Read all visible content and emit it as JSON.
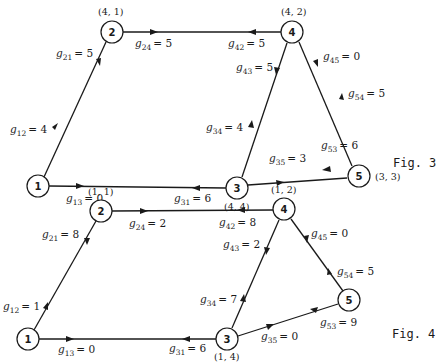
{
  "figures": [
    {
      "caption": "Fig. 3",
      "nodes": [
        {
          "id": "1",
          "coord": ""
        },
        {
          "id": "2",
          "coord": "(4, 1)"
        },
        {
          "id": "3",
          "coord": "(4, 4)"
        },
        {
          "id": "4",
          "coord": "(4, 2)"
        },
        {
          "id": "5",
          "coord": "(3, 3)"
        }
      ],
      "edges": [
        {
          "var": "g",
          "sub": "21",
          "value": "= 5"
        },
        {
          "var": "g",
          "sub": "12",
          "value": "= 4"
        },
        {
          "var": "g",
          "sub": "24",
          "value": "= 5"
        },
        {
          "var": "g",
          "sub": "42",
          "value": "= 5"
        },
        {
          "var": "g",
          "sub": "13",
          "value": "= 0"
        },
        {
          "var": "g",
          "sub": "31",
          "value": "= 6"
        },
        {
          "var": "g",
          "sub": "43",
          "value": "= 5"
        },
        {
          "var": "g",
          "sub": "34",
          "value": "= 4"
        },
        {
          "var": "g",
          "sub": "45",
          "value": "= 0"
        },
        {
          "var": "g",
          "sub": "54",
          "value": "= 5"
        },
        {
          "var": "g",
          "sub": "35",
          "value": "= 3"
        },
        {
          "var": "g",
          "sub": "53",
          "value": "= 6"
        }
      ]
    },
    {
      "caption": "Fig. 4",
      "nodes": [
        {
          "id": "1",
          "coord": ""
        },
        {
          "id": "2",
          "coord": "(1, 1)"
        },
        {
          "id": "3",
          "coord": "(1, 4)"
        },
        {
          "id": "4",
          "coord": "(1, 2)"
        },
        {
          "id": "5",
          "coord": ""
        }
      ],
      "edges": [
        {
          "var": "g",
          "sub": "21",
          "value": "= 8"
        },
        {
          "var": "g",
          "sub": "12",
          "value": "= 1"
        },
        {
          "var": "g",
          "sub": "24",
          "value": "= 2"
        },
        {
          "var": "g",
          "sub": "42",
          "value": "= 8"
        },
        {
          "var": "g",
          "sub": "13",
          "value": "= 0"
        },
        {
          "var": "g",
          "sub": "31",
          "value": "= 6"
        },
        {
          "var": "g",
          "sub": "43",
          "value": "= 2"
        },
        {
          "var": "g",
          "sub": "34",
          "value": "= 7"
        },
        {
          "var": "g",
          "sub": "45",
          "value": "= 0"
        },
        {
          "var": "g",
          "sub": "54",
          "value": "= 5"
        },
        {
          "var": "g",
          "sub": "35",
          "value": "= 0"
        },
        {
          "var": "g",
          "sub": "53",
          "value": "= 9"
        }
      ]
    }
  ]
}
